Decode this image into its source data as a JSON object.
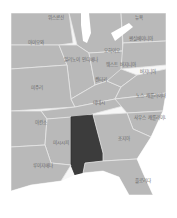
{
  "map": {
    "title": "미국 동남부",
    "highlighted_state": "앨라배마",
    "colors": {
      "land": "#b9b9b9",
      "highlight": "#3c3c3c",
      "border": "#e6e6e6",
      "water": "#ffffff",
      "label": "#666666"
    },
    "labels": {
      "wisconsin": "위스콘신",
      "michigan": "미시간",
      "newyork": "뉴욕",
      "iowa": "아이오와",
      "illinois": "일리노이 인디애나",
      "ohio": "오하이오",
      "pennsylvania": "펜실베이니아",
      "missouri": "미주리",
      "kentucky": "켄터키",
      "westvirginia": "웨스트 버지니아",
      "virginia": "버지니아",
      "tennessee": "테네시",
      "northcarolina": "노스 캐롤라이나",
      "arkansas": "아칸소",
      "southcarolina": "사우스 캐롤라이나",
      "mississippi": "미시시피",
      "alabama": "앨라배마",
      "georgia": "조지아",
      "louisiana": "루이지애나",
      "florida": "플로리다"
    }
  }
}
